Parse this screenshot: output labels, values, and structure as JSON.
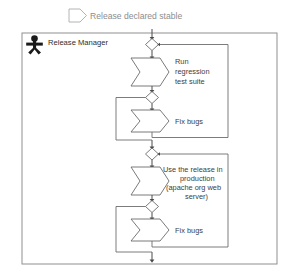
{
  "diagram": {
    "type": "uml-activity-diagram",
    "signal_event": {
      "icon": "signal-receipt-chevron-icon",
      "label": "Release declared stable"
    },
    "swimlane": {
      "actor_icon": "actor-stick-figure-icon",
      "label": "Release Manager"
    },
    "nodes": [
      {
        "id": "merge-1",
        "type": "merge-diamond",
        "label": ""
      },
      {
        "id": "activity-1",
        "type": "activity-chevron",
        "label_lines": [
          "Run",
          "regression",
          "test suite"
        ]
      },
      {
        "id": "decision-1",
        "type": "decision-diamond",
        "label": ""
      },
      {
        "id": "activity-2",
        "type": "activity-chevron",
        "label_lines": [
          "Fix bugs"
        ]
      },
      {
        "id": "merge-2",
        "type": "merge-diamond",
        "label": ""
      },
      {
        "id": "activity-3",
        "type": "activity-chevron",
        "label_lines": [
          "Use the release in",
          "production",
          "(apache org web",
          "server)"
        ]
      },
      {
        "id": "decision-2",
        "type": "decision-diamond",
        "label": ""
      },
      {
        "id": "activity-4",
        "type": "activity-chevron",
        "label_lines": [
          "Fix bugs"
        ]
      }
    ],
    "labels": {
      "run_regression_line1": "Run",
      "run_regression_line2": "regression",
      "run_regression_line3": "test suite",
      "fix_bugs_upper": "Fix bugs",
      "use_release_line1": "Use the release in",
      "use_release_line2": "production",
      "use_release_line3": "(apache org web",
      "use_release_line4": "server)",
      "fix_bugs_lower": "Fix bugs"
    },
    "colors": {
      "edge": "#6d6d6d",
      "node_stroke": "#6b6b6b",
      "lane_stroke": "#8f8f8f",
      "text": "#3d3d3d",
      "signal_text": "#8d8d8d",
      "actor": "#1a1a1a",
      "background": "#ffffff"
    }
  }
}
